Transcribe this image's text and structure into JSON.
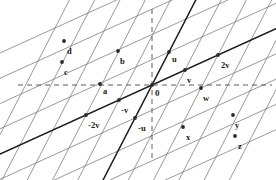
{
  "figure": {
    "type": "lattice-vector-diagram",
    "width": 276,
    "height": 180,
    "background": "#ffffff",
    "ink_color": "#3a3a3a",
    "emphasis_color": "#1f1f1f",
    "dot_color": "#2a2a2a",
    "label_color": "#1b1b1b"
  },
  "axes": {
    "horizontal": {
      "name": "horizontal-dashed-axis",
      "y": 85,
      "x_start": 18,
      "x_end": 272,
      "style": "dashed"
    },
    "vertical": {
      "name": "vertical-dashed-axis",
      "x": 152,
      "y_start": 9,
      "y_end": 162,
      "style": "dashed"
    }
  },
  "basis": {
    "origin": {
      "x": 152,
      "y": 85
    },
    "u": {
      "dx": 17,
      "dy": -33
    },
    "v": {
      "dx": 33,
      "dy": -15
    }
  },
  "grid": {
    "u_family_count": 11,
    "v_family_count": 9,
    "line_color": "#6e6e6e",
    "line_width": 0.7
  },
  "emphasis_lines": [
    {
      "name": "u-direction-line",
      "through": "origin",
      "direction": "u"
    },
    {
      "name": "v-direction-line",
      "through": "origin",
      "direction": "v"
    }
  ],
  "points": [
    {
      "id": "origin",
      "label": "0",
      "x": 152,
      "y": 85,
      "lx": 155,
      "ly": 89,
      "show_dot": true
    },
    {
      "id": "u",
      "label": "u",
      "x": 169,
      "y": 52,
      "lx": 172,
      "ly": 55
    },
    {
      "id": "v",
      "label": "v",
      "x": 185,
      "y": 70,
      "lx": 187,
      "ly": 76
    },
    {
      "id": "2v",
      "label": "2v",
      "x": 218,
      "y": 55,
      "lx": 221,
      "ly": 61
    },
    {
      "id": "-v",
      "label": "-v",
      "x": 119,
      "y": 100,
      "lx": 121,
      "ly": 106
    },
    {
      "id": "-2v",
      "label": "-2v",
      "x": 86,
      "y": 115,
      "lx": 88,
      "ly": 121
    },
    {
      "id": "-u",
      "label": "-u",
      "x": 135,
      "y": 118,
      "lx": 138,
      "ly": 124
    },
    {
      "id": "a",
      "label": "a",
      "x": 100,
      "y": 84,
      "lx": 103,
      "ly": 87
    },
    {
      "id": "b",
      "label": "b",
      "x": 118,
      "y": 51,
      "lx": 120,
      "ly": 57
    },
    {
      "id": "c",
      "label": "c",
      "x": 62,
      "y": 62,
      "lx": 64,
      "ly": 68
    },
    {
      "id": "d",
      "label": "d",
      "x": 64,
      "y": 41,
      "lx": 67,
      "ly": 47
    },
    {
      "id": "w",
      "label": "w",
      "x": 201,
      "y": 88,
      "lx": 203,
      "ly": 94
    },
    {
      "id": "x",
      "label": "x",
      "x": 183,
      "y": 127,
      "lx": 186,
      "ly": 133
    },
    {
      "id": "y",
      "label": "y",
      "x": 233,
      "y": 115,
      "lx": 235,
      "ly": 121
    },
    {
      "id": "z",
      "label": "z",
      "x": 235,
      "y": 136,
      "lx": 238,
      "ly": 142
    }
  ]
}
